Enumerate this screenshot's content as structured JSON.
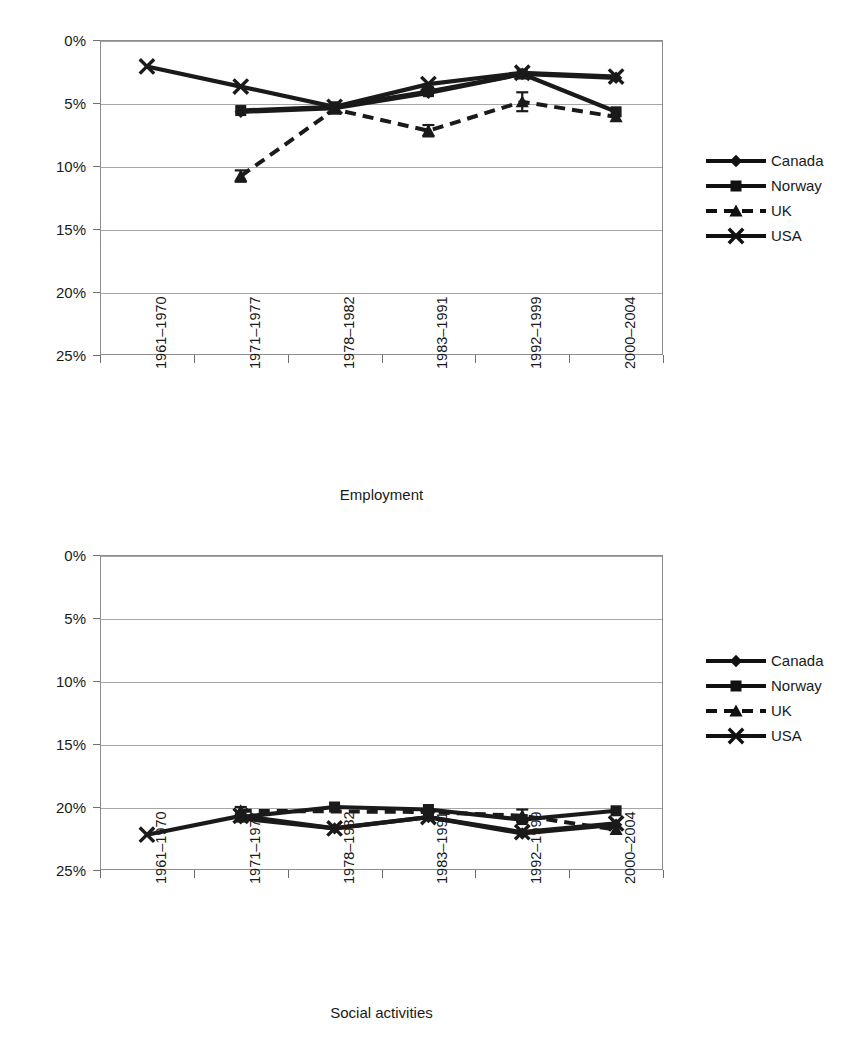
{
  "page": {
    "background": "#ffffff",
    "ink": "#1a1a1a",
    "gridline_color": "#a6a6a6",
    "frame_color": "#8c8c8c"
  },
  "legend_entries": [
    {
      "label": "Canada",
      "marker": "diamond",
      "dash": "solid",
      "color": "#111111"
    },
    {
      "label": "Norway",
      "marker": "square",
      "dash": "solid",
      "color": "#111111"
    },
    {
      "label": "UK",
      "marker": "triangle",
      "dash": "dashed",
      "color": "#111111"
    },
    {
      "label": "USA",
      "marker": "cross",
      "dash": "solid",
      "color": "#111111"
    }
  ],
  "y_tick_labels": [
    "25%",
    "20%",
    "15%",
    "10%",
    "5%",
    "0%"
  ],
  "x_tick_labels": [
    "1961–1970",
    "1971–1977",
    "1978–1982",
    "1983–1991",
    "1992–1999",
    "2000–2004"
  ],
  "chart_data": [
    {
      "type": "line",
      "id": "employment",
      "title": "",
      "xlabel": "Employment",
      "ylabel": "",
      "ylim": [
        0,
        25
      ],
      "ytick_values": [
        0,
        5,
        10,
        15,
        20,
        25
      ],
      "ytick_format": "percent",
      "grid": true,
      "legend_position": "right",
      "categories": [
        "1961–1970",
        "1971–1977",
        "1978–1982",
        "1983–1991",
        "1992–1999",
        "2000–2004"
      ],
      "series": [
        {
          "name": "Canada",
          "marker": "diamond",
          "dash": "solid",
          "values": [
            null,
            19.3,
            19.6,
            20.8,
            22.3,
            22.0
          ],
          "errors": [
            null,
            null,
            null,
            null,
            null,
            null
          ]
        },
        {
          "name": "Norway",
          "marker": "square",
          "dash": "solid",
          "values": [
            null,
            19.4,
            19.7,
            20.9,
            22.3,
            19.3
          ],
          "errors": [
            null,
            null,
            null,
            null,
            null,
            null
          ]
        },
        {
          "name": "UK",
          "marker": "triangle",
          "dash": "dashed",
          "values": [
            null,
            14.2,
            19.5,
            17.8,
            20.1,
            18.9
          ],
          "errors": [
            null,
            0.45,
            null,
            0.45,
            0.75,
            null
          ]
        },
        {
          "name": "USA",
          "marker": "cross",
          "dash": "solid",
          "values": [
            22.9,
            21.3,
            19.7,
            21.5,
            22.4,
            22.1
          ],
          "errors": [
            null,
            null,
            null,
            null,
            null,
            null
          ]
        }
      ]
    },
    {
      "type": "line",
      "id": "social-activities",
      "title": "",
      "xlabel": "Social activities",
      "ylabel": "",
      "ylim": [
        0,
        25
      ],
      "ytick_values": [
        0,
        5,
        10,
        15,
        20,
        25
      ],
      "ytick_format": "percent",
      "grid": true,
      "legend_position": "right",
      "categories": [
        "1961–1970",
        "1971–1977",
        "1978–1982",
        "1983–1991",
        "1992–1999",
        "2000–2004"
      ],
      "series": [
        {
          "name": "Canada",
          "marker": "diamond",
          "dash": "solid",
          "values": [
            null,
            4.1,
            3.3,
            4.2,
            2.9,
            3.6
          ],
          "errors": [
            null,
            null,
            null,
            null,
            null,
            null
          ]
        },
        {
          "name": "Norway",
          "marker": "square",
          "dash": "solid",
          "values": [
            null,
            4.2,
            5.0,
            4.8,
            4.0,
            4.7
          ],
          "errors": [
            null,
            null,
            null,
            null,
            null,
            null
          ]
        },
        {
          "name": "UK",
          "marker": "triangle",
          "dash": "dashed",
          "values": [
            null,
            4.7,
            null,
            4.6,
            4.3,
            3.2
          ],
          "errors": [
            null,
            0.3,
            null,
            null,
            0.5,
            null
          ]
        },
        {
          "name": "USA",
          "marker": "cross",
          "dash": "solid",
          "values": [
            2.8,
            4.3,
            3.3,
            4.2,
            3.0,
            3.7
          ],
          "errors": [
            null,
            null,
            null,
            null,
            null,
            null
          ]
        }
      ]
    }
  ],
  "charts_layout": [
    {
      "id": "employment",
      "plot": {
        "left": 100,
        "top": 40,
        "width": 563,
        "height": 315
      },
      "axis_title_top": 487,
      "legend_top": 148
    },
    {
      "id": "social-activities",
      "plot": {
        "left": 100,
        "top": 32,
        "width": 563,
        "height": 315
      },
      "axis_title_top": 482,
      "legend_top": 125
    }
  ]
}
